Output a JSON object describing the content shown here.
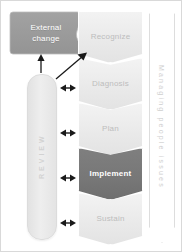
{
  "diagram": {
    "external": {
      "label_line1": "External",
      "label_line2": "change",
      "color": "#999999",
      "text_color": "#ffffff"
    },
    "review": {
      "label": "REVIEW",
      "color": "#e9e9e9",
      "text_color": "#d2d2d2"
    },
    "banner": {
      "label": "Managing people issues",
      "color": "#ffffff",
      "text_color": "#cfcfcf"
    },
    "stages": [
      {
        "label": "Recognize",
        "highlighted": false,
        "color": "#ededed",
        "text_color": "#bdbdbd"
      },
      {
        "label": "Diagnosis",
        "highlighted": false,
        "color": "#ededed",
        "text_color": "#bdbdbd"
      },
      {
        "label": "Plan",
        "highlighted": false,
        "color": "#ededed",
        "text_color": "#bdbdbd"
      },
      {
        "label": "Implement",
        "highlighted": true,
        "color": "#777777",
        "text_color": "#ffffff"
      },
      {
        "label": "Sustain",
        "highlighted": false,
        "color": "#ededed",
        "text_color": "#bdbdbd"
      }
    ],
    "connectors": {
      "up_arrow": "review-to-external-change",
      "diagonal_arrow": "review-to-recognize",
      "double_arrows": [
        "review-to-diagnosis",
        "review-to-plan",
        "review-to-implement",
        "review-to-sustain"
      ],
      "color": "#1a1a1a"
    }
  }
}
